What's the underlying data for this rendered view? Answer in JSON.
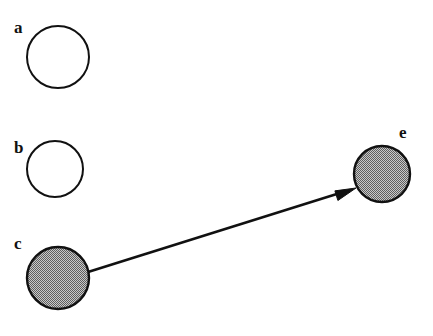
{
  "figure": {
    "width": 433,
    "height": 336,
    "background_color": "#ffffff",
    "stroke_color": "#111111",
    "fill_gray": "#9a9a9a",
    "nodes": [
      {
        "id": "a",
        "label": "a",
        "cx": 58,
        "cy": 57,
        "r": 31,
        "filled": false,
        "label_x": 14,
        "label_y": 19
      },
      {
        "id": "b",
        "label": "b",
        "cx": 55,
        "cy": 169,
        "r": 28,
        "filled": false,
        "label_x": 14,
        "label_y": 139
      },
      {
        "id": "c",
        "label": "c",
        "cx": 58,
        "cy": 278,
        "r": 31,
        "filled": true,
        "label_x": 14,
        "label_y": 235
      },
      {
        "id": "e",
        "label": "e",
        "cx": 382,
        "cy": 174,
        "r": 28,
        "filled": true,
        "label_x": 399,
        "label_y": 124
      }
    ],
    "edges": [
      {
        "id": "c-to-e",
        "from": "c",
        "to": "e",
        "directed": true,
        "x1": 88,
        "y1": 272,
        "x2": 356,
        "y2": 188,
        "stroke_width": 2.6,
        "arrow_length": 21,
        "arrow_width": 13
      }
    ]
  }
}
